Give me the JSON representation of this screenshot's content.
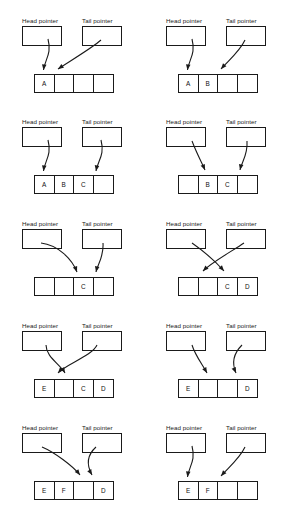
{
  "diagram": {
    "type": "ring-buffer-sequence",
    "labels": {
      "head": "Head pointer",
      "tail": "Tail pointer"
    },
    "array_size": 4,
    "colors": {
      "stroke": "#1a1a1a",
      "background": "#ffffff",
      "text": "#111111"
    },
    "panels": [
      {
        "index": 1,
        "cells": [
          "A",
          "",
          "",
          ""
        ],
        "head_target_cell": 0,
        "tail_target_cell": 1,
        "head_arrow": {
          "x1": 48,
          "y1": 30,
          "x2": 43.5,
          "y2": 61,
          "c1x": 52,
          "c1y": 45,
          "c2x": 45,
          "c2y": 50
        },
        "tail_arrow": {
          "x1": 101,
          "y1": 31,
          "x2": 58,
          "y2": 60,
          "c1x": 92,
          "c1y": 39,
          "c2x": 70,
          "c2y": 52
        },
        "arrows_cross": false
      },
      {
        "index": 2,
        "cells": [
          "A",
          "B",
          "",
          ""
        ],
        "head_target_cell": 0,
        "tail_target_cell": 2,
        "head_arrow": {
          "x1": 48,
          "y1": 30,
          "x2": 43.5,
          "y2": 61,
          "c1x": 52,
          "c1y": 45,
          "c2x": 45,
          "c2y": 50
        },
        "tail_arrow": {
          "x1": 101,
          "y1": 31,
          "x2": 77,
          "y2": 60,
          "c1x": 96,
          "c1y": 42,
          "c2x": 85,
          "c2y": 51
        },
        "arrows_cross": false
      },
      {
        "index": 3,
        "cells": [
          "A",
          "B",
          "C",
          ""
        ],
        "head_target_cell": 0,
        "tail_target_cell": 3,
        "head_arrow": {
          "x1": 48,
          "y1": 30,
          "x2": 43.5,
          "y2": 61,
          "c1x": 52,
          "c1y": 45,
          "c2x": 45,
          "c2y": 50
        },
        "tail_arrow": {
          "x1": 101,
          "y1": 30,
          "x2": 96,
          "y2": 61,
          "c1x": 105,
          "c1y": 45,
          "c2x": 98,
          "c2y": 50
        },
        "arrows_cross": false
      },
      {
        "index": 4,
        "cells": [
          "",
          "B",
          "C",
          ""
        ],
        "head_target_cell": 1,
        "tail_target_cell": 3,
        "head_arrow": {
          "x1": 48,
          "y1": 31,
          "x2": 61,
          "y2": 60,
          "c1x": 53,
          "c1y": 44,
          "c2x": 57,
          "c2y": 51
        },
        "tail_arrow": {
          "x1": 103,
          "y1": 31,
          "x2": 96,
          "y2": 60,
          "c1x": 104,
          "c1y": 45,
          "c2x": 98,
          "c2y": 51
        },
        "arrows_cross": false
      },
      {
        "index": 5,
        "cells": [
          "",
          "",
          "C",
          ""
        ],
        "head_target_cell": 2,
        "tail_target_cell": 3,
        "head_arrow": {
          "x1": 41,
          "y1": 31,
          "x2": 77,
          "y2": 60,
          "c1x": 58,
          "c1y": 33,
          "c2x": 72,
          "c2y": 47
        },
        "tail_arrow": {
          "x1": 103,
          "y1": 31,
          "x2": 96,
          "y2": 60,
          "c1x": 104,
          "c1y": 45,
          "c2x": 98,
          "c2y": 51
        },
        "arrows_cross": false
      },
      {
        "index": 6,
        "cells": [
          "",
          "",
          "C",
          "D"
        ],
        "head_target_cell": 1,
        "tail_target_cell": 2,
        "head_arrow": {
          "x1": 48,
          "y1": 31,
          "x2": 80,
          "y2": 59,
          "c1x": 58,
          "c1y": 38,
          "c2x": 72,
          "c2y": 50
        },
        "tail_arrow": {
          "x1": 100,
          "y1": 31,
          "x2": 59,
          "y2": 59,
          "c1x": 90,
          "c1y": 38,
          "c2x": 68,
          "c2y": 50
        },
        "arrows_cross": true
      },
      {
        "index": 7,
        "cells": [
          "E",
          "",
          "C",
          "D"
        ],
        "head_target_cell": 1,
        "tail_target_cell": 1,
        "head_arrow": {
          "x1": 46,
          "y1": 31,
          "x2": 65,
          "y2": 59,
          "c1x": 46,
          "c1y": 43,
          "c2x": 60,
          "c2y": 50
        },
        "tail_arrow": {
          "x1": 97,
          "y1": 31,
          "x2": 58,
          "y2": 59,
          "c1x": 92,
          "c1y": 42,
          "c2x": 66,
          "c2y": 50
        },
        "arrows_cross": true
      },
      {
        "index": 8,
        "cells": [
          "E",
          "",
          "",
          "D"
        ],
        "head_target_cell": 1,
        "tail_target_cell": 3,
        "head_arrow": {
          "x1": 48,
          "y1": 31,
          "x2": 63,
          "y2": 59,
          "c1x": 51,
          "c1y": 41,
          "c2x": 58,
          "c2y": 50
        },
        "tail_arrow": {
          "x1": 98,
          "y1": 31,
          "x2": 92,
          "y2": 59,
          "c1x": 88,
          "c1y": 41,
          "c2x": 88,
          "c2y": 50
        },
        "arrows_cross": true
      },
      {
        "index": 9,
        "cells": [
          "E",
          "F",
          "",
          "D"
        ],
        "head_target_cell": 2,
        "tail_target_cell": 3,
        "head_arrow": {
          "x1": 42,
          "y1": 31,
          "x2": 80,
          "y2": 59,
          "c1x": 54,
          "c1y": 36,
          "c2x": 73,
          "c2y": 50
        },
        "tail_arrow": {
          "x1": 96,
          "y1": 31,
          "x2": 92,
          "y2": 59,
          "c1x": 86,
          "c1y": 40,
          "c2x": 87,
          "c2y": 50
        },
        "arrows_cross": true
      },
      {
        "index": 10,
        "cells": [
          "E",
          "F",
          "",
          ""
        ],
        "head_target_cell": 0,
        "tail_target_cell": 2,
        "head_arrow": {
          "x1": 48,
          "y1": 30,
          "x2": 43.5,
          "y2": 61,
          "c1x": 52,
          "c1y": 45,
          "c2x": 45,
          "c2y": 50
        },
        "tail_arrow": {
          "x1": 101,
          "y1": 31,
          "x2": 77,
          "y2": 60,
          "c1x": 96,
          "c1y": 42,
          "c2x": 85,
          "c2y": 51
        },
        "arrows_cross": false
      }
    ]
  }
}
